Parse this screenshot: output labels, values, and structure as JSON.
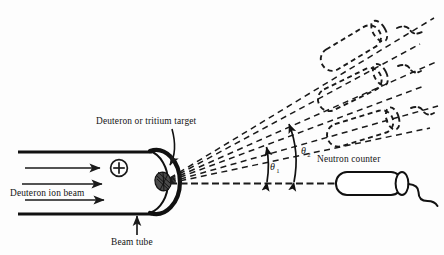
{
  "figure": {
    "background_color": "#fdfdfd",
    "ink_color": "#1a1a1a",
    "width": 444,
    "height": 255
  },
  "labels": {
    "beam_source": "Deuteron ion beam",
    "target": "Deuteron or tritium target",
    "beam_tube": "Beam tube",
    "counter": "Neutron counter",
    "theta1": "θ",
    "theta1_sub": "1",
    "theta2": "θ",
    "theta2_sub": "2",
    "charge_symbol": "⊕"
  },
  "components": {
    "beam_tube": {
      "name": "beam-tube",
      "wall_top_y": 152,
      "wall_bottom_y": 214,
      "left_x": 18,
      "right_x": 150
    },
    "target": {
      "name": "target-spot",
      "cx": 163,
      "cy": 181,
      "rx": 8,
      "ry": 9
    },
    "neutron_counter_solid": {
      "name": "neutron-counter-active",
      "angle_deg": 0,
      "position_label": "on-axis"
    },
    "neutron_counter_ghosts": [
      {
        "name": "counter-ghost-low",
        "angle_deg": 18
      },
      {
        "name": "counter-ghost-mid",
        "angle_deg": 30
      },
      {
        "name": "counter-ghost-high",
        "angle_deg": 42
      }
    ],
    "scattering_rays": [
      {
        "name": "ray-axis",
        "angle_deg": 0
      },
      {
        "name": "ray-1",
        "angle_deg": 14
      },
      {
        "name": "ray-2",
        "angle_deg": 20
      },
      {
        "name": "ray-3",
        "angle_deg": 27
      },
      {
        "name": "ray-4",
        "angle_deg": 33
      },
      {
        "name": "ray-5",
        "angle_deg": 40
      },
      {
        "name": "ray-6",
        "angle_deg": 46
      }
    ],
    "beam_arrows": [
      {
        "name": "beam-arrow-top",
        "y": 168
      },
      {
        "name": "beam-arrow-mid",
        "y": 183
      },
      {
        "name": "beam-arrow-bottom",
        "y": 199
      }
    ],
    "angle_markers": [
      {
        "name": "angle-theta-1",
        "label": "θ₁",
        "apex_x": 268
      },
      {
        "name": "angle-theta-2",
        "label": "θ₂",
        "apex_x": 294
      }
    ]
  }
}
